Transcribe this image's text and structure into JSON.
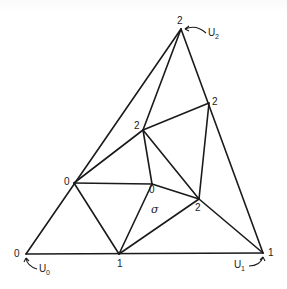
{
  "diagram": {
    "type": "triangulation",
    "vertices": [
      {
        "id": "top",
        "x": 181,
        "y": 29,
        "label": "2"
      },
      {
        "id": "right_mid",
        "x": 209,
        "y": 103,
        "label": "2"
      },
      {
        "id": "inner_upper",
        "x": 143,
        "y": 130,
        "label": "2"
      },
      {
        "id": "left_mid",
        "x": 74,
        "y": 183,
        "label": "0"
      },
      {
        "id": "center",
        "x": 152,
        "y": 184,
        "label": "0"
      },
      {
        "id": "inner_lower",
        "x": 199,
        "y": 199,
        "label": "2"
      },
      {
        "id": "bottom_left",
        "x": 26,
        "y": 254,
        "label": "0"
      },
      {
        "id": "bottom_mid",
        "x": 119,
        "y": 254,
        "label": "1"
      },
      {
        "id": "bottom_right",
        "x": 263,
        "y": 253,
        "label": "1"
      }
    ],
    "edges": [
      [
        "bottom_left",
        "top"
      ],
      [
        "top",
        "bottom_right"
      ],
      [
        "bottom_left",
        "bottom_right"
      ],
      [
        "top",
        "inner_upper"
      ],
      [
        "inner_upper",
        "right_mid"
      ],
      [
        "right_mid",
        "inner_lower"
      ],
      [
        "inner_upper",
        "left_mid"
      ],
      [
        "inner_upper",
        "center"
      ],
      [
        "inner_upper",
        "inner_lower"
      ],
      [
        "left_mid",
        "center"
      ],
      [
        "center",
        "inner_lower"
      ],
      [
        "left_mid",
        "bottom_mid"
      ],
      [
        "center",
        "bottom_mid"
      ],
      [
        "bottom_mid",
        "inner_lower"
      ],
      [
        "inner_lower",
        "bottom_right"
      ]
    ],
    "corner_labels": {
      "u0": {
        "main": "U",
        "sub": "0"
      },
      "u1": {
        "main": "U",
        "sub": "1"
      },
      "u2": {
        "main": "U",
        "sub": "2"
      }
    },
    "simplex_label": "σ"
  }
}
